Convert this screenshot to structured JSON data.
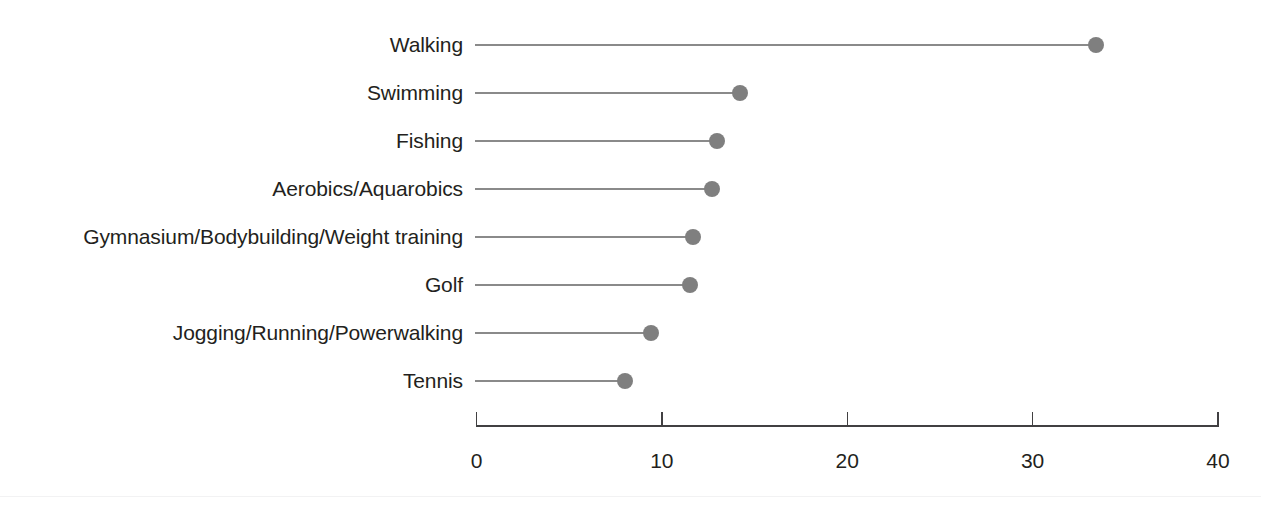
{
  "chart_data": {
    "type": "bar",
    "subtype": "lollipop-horizontal",
    "title": "",
    "subtitle": "",
    "xlabel": "",
    "ylabel": "",
    "categories": [
      "Walking",
      "Swimming",
      "Fishing",
      "Aerobics/Aquarobics",
      "Gymnasium/Bodybuilding/Weight training",
      "Golf",
      "Jogging/Running/Powerwalking",
      "Tennis"
    ],
    "values": [
      33.4,
      14.2,
      13.0,
      12.7,
      11.7,
      11.5,
      9.4,
      8.0
    ],
    "xlim": [
      0,
      40
    ],
    "xticks": [
      0,
      10,
      20,
      30,
      40
    ],
    "xtick_labels": [
      "0",
      "10",
      "20",
      "30",
      "40"
    ],
    "grid": false,
    "legend": null,
    "annotations": [],
    "marker_color": "#7f7f7f",
    "stem_color": "#8a8a8a",
    "axis_color": "#414042",
    "text_color": "#231f20",
    "background_color": "#ffffff"
  }
}
